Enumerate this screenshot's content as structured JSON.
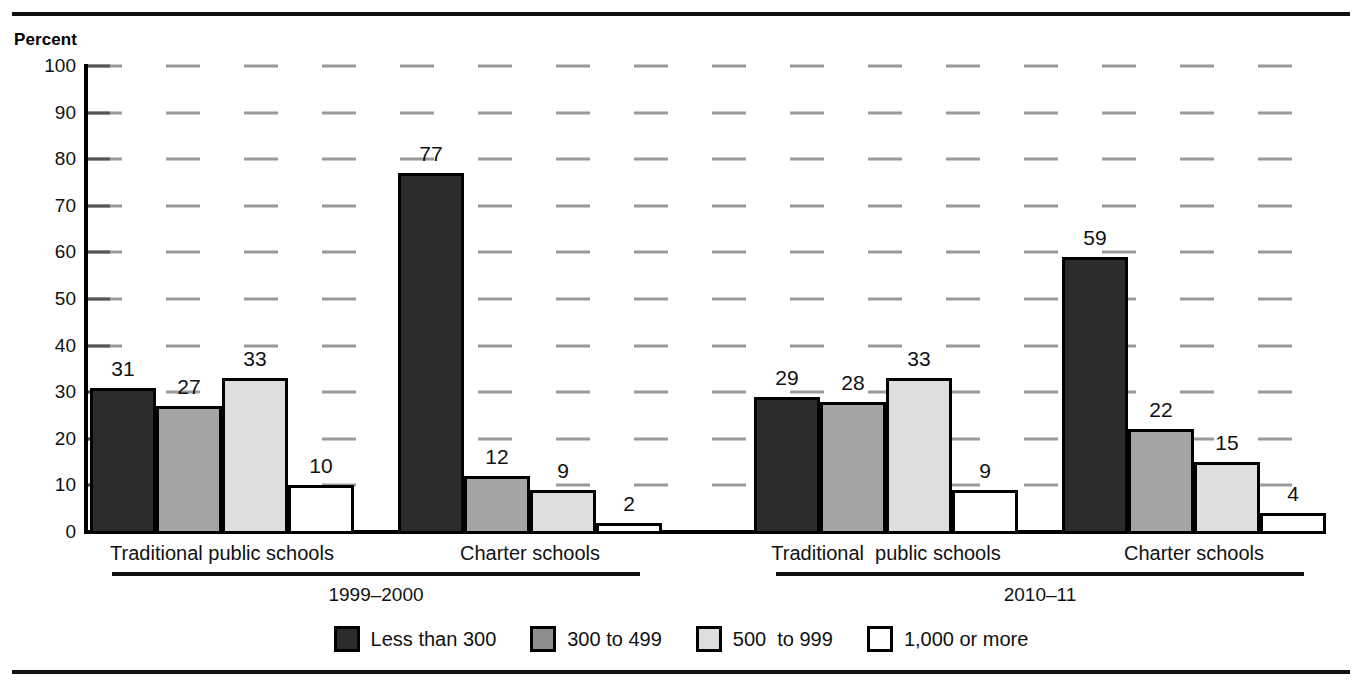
{
  "chart_data": {
    "type": "bar",
    "title": "",
    "subtitle": "",
    "xlabel": "",
    "ylabel": "Percent",
    "ylim": [
      0,
      100
    ],
    "ytick_step": 10,
    "yticks": [
      0,
      10,
      20,
      30,
      40,
      50,
      60,
      70,
      80,
      90,
      100
    ],
    "ytick_labels": [
      "0",
      "10",
      "20",
      "30",
      "40",
      "50",
      "60",
      "70",
      "80",
      "90",
      "100"
    ],
    "grid": true,
    "grid_style": "dashed",
    "legend_position": "bottom",
    "legend": [
      "Less than 300",
      "300 to 499",
      "500  to 999",
      "1,000 or more"
    ],
    "series": [
      {
        "name": "Less than 300",
        "color": "#2c2c2c",
        "values": [
          31,
          77,
          29,
          59
        ]
      },
      {
        "name": "300 to 499",
        "color": "#a4a4a4",
        "values": [
          27,
          12,
          28,
          22
        ]
      },
      {
        "name": "500  to 999",
        "color": "#dededd",
        "values": [
          33,
          9,
          33,
          15
        ]
      },
      {
        "name": "1,000 or more",
        "color": "#ffffff",
        "values": [
          10,
          2,
          9,
          4
        ]
      }
    ],
    "categories": [
      "Traditional public schools",
      "Charter schools",
      "Traditional  public schools",
      "Charter schools"
    ],
    "super_groups": [
      {
        "label": "1999–2000",
        "categories": [
          0,
          1
        ]
      },
      {
        "label": "2010–11",
        "categories": [
          2,
          3
        ]
      }
    ],
    "annotations": {
      "bar_value_labels": [
        [
          31,
          27,
          33,
          10
        ],
        [
          77,
          12,
          9,
          2
        ],
        [
          29,
          28,
          33,
          9
        ],
        [
          59,
          22,
          15,
          4
        ]
      ]
    }
  },
  "axis": {
    "percent_label": "Percent"
  },
  "ticks": {
    "t100": "100",
    "t90": "90",
    "t80": "80",
    "t70": "70",
    "t60": "60",
    "t50": "50",
    "t40": "40",
    "t30": "30",
    "t20": "20",
    "t10": "10",
    "t0": "0"
  },
  "groups": [
    {
      "label": "Traditional public schools",
      "values": [
        "31",
        "27",
        "33",
        "10"
      ]
    },
    {
      "label": "Charter schools",
      "values": [
        "77",
        "12",
        "9",
        "2"
      ]
    },
    {
      "label": "Traditional  public schools",
      "values": [
        "29",
        "28",
        "33",
        "9"
      ]
    },
    {
      "label": "Charter schools",
      "values": [
        "59",
        "22",
        "15",
        "4"
      ]
    }
  ],
  "years": [
    {
      "label": "1999–2000"
    },
    {
      "label": "2010–11"
    }
  ],
  "legend": {
    "items": [
      {
        "label": "Less than 300",
        "swatch": "swatch-dark"
      },
      {
        "label": "300 to 499",
        "swatch": "swatch-medium-gray"
      },
      {
        "label": "500  to 999",
        "swatch": "swatch-light-gray"
      },
      {
        "label": "1,000 or more",
        "swatch": "swatch-white"
      }
    ]
  },
  "colors": {
    "series_1": "#2c2c2c",
    "series_2": "#a4a4a4",
    "series_3": "#dededd",
    "series_4": "#ffffff",
    "grid": "#9a9a9a",
    "rule": "#111111"
  }
}
